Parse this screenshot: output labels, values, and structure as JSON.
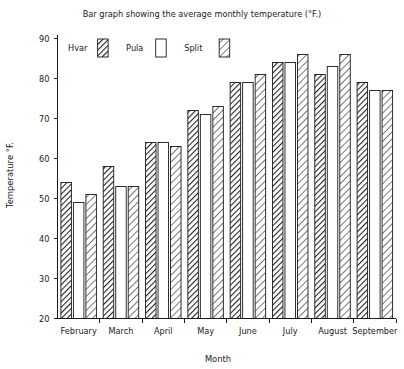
{
  "chart_data": {
    "type": "bar",
    "title": "Bar graph showing the average monthly temperature (°F.)",
    "xlabel": "Month",
    "ylabel": "Temperature °F.",
    "categories": [
      "February",
      "March",
      "April",
      "May",
      "June",
      "July",
      "August",
      "September"
    ],
    "ylim": [
      20,
      90
    ],
    "ytick_values": [
      20,
      30,
      40,
      50,
      60,
      70,
      80,
      90
    ],
    "ytick_labels": [
      "20",
      "30",
      "40",
      "50",
      "60",
      "70",
      "80",
      "90"
    ],
    "grid": false,
    "legend_position": "top-left inside axes",
    "series": [
      {
        "name": "Hvar",
        "pattern": "dense-diagonal-hatch",
        "values": [
          54,
          58,
          64,
          72,
          79,
          84,
          81,
          79
        ]
      },
      {
        "name": "Pula",
        "pattern": "empty-white",
        "values": [
          49,
          53,
          64,
          71,
          79,
          84,
          83,
          77
        ]
      },
      {
        "name": "Split",
        "pattern": "light-diagonal-hatch",
        "values": [
          51,
          53,
          63,
          73,
          81,
          86,
          86,
          77
        ]
      }
    ]
  },
  "legend": {
    "entries": [
      {
        "label": "Hvar"
      },
      {
        "label": "Pula"
      },
      {
        "label": "Split"
      }
    ]
  },
  "colors": {
    "ink": "#1a1a1a",
    "background": "#ffffff",
    "bar_fill_empty": "#ffffff",
    "hatch_stroke": "#2b2b2b"
  }
}
